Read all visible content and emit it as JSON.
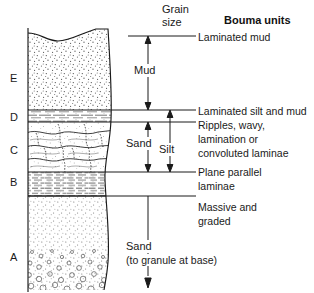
{
  "figure": {
    "grain_size_header": "Grain\nsize",
    "bouma_units_header": "Bouma units"
  },
  "units": [
    {
      "letter": "E",
      "pattern": "stipple-mud",
      "description": "Laminated mud"
    },
    {
      "letter": "D",
      "pattern": "laminated-silt",
      "description": "Laminated silt and mud"
    },
    {
      "letter": "C",
      "pattern": "ripple-cross",
      "description": "Ripples, wavy,\nlamination or\nconvoluted laminae"
    },
    {
      "letter": "B",
      "pattern": "plane-parallel",
      "description": "Plane parallel\nlaminae"
    },
    {
      "letter": "A",
      "pattern": "graded-sand",
      "description": "Massive and\ngraded"
    }
  ],
  "grain_size_arrows": [
    {
      "label": "Mud",
      "kind": "double-headed"
    },
    {
      "label": "Sand",
      "kind": "double-headed"
    },
    {
      "label": "Silt",
      "kind": "double-headed"
    },
    {
      "label": "Sand",
      "kind": "single-down",
      "sublabel": "(to granule at base)"
    }
  ],
  "descriptions": {
    "laminated_mud": "Laminated mud",
    "laminated_silt_and_mud": "Laminated silt and mud",
    "ripples_line1": "Ripples, wavy,",
    "ripples_line2": "lamination or",
    "ripples_line3": "convoluted laminae",
    "plane_line1": "Plane parallel",
    "plane_line2": "laminae",
    "massive_line1": "Massive and",
    "massive_line2": "graded",
    "sand_base_line1": "Sand",
    "sand_base_line2": "(to granule at base)"
  },
  "labels": {
    "grain_line1": "Grain",
    "grain_line2": "size",
    "bouma": "Bouma units",
    "mud": "Mud",
    "sand_upper": "Sand",
    "silt": "Silt"
  },
  "colors": {
    "ink": "#1a1a1a",
    "rule": "#2b2b2b",
    "paper": "#ffffff",
    "stipple": "#555555"
  }
}
